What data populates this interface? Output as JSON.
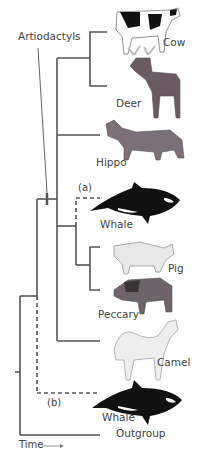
{
  "diagram": {
    "type": "phylogenetic_tree",
    "clade_label": "Artiodactyls",
    "time_axis_label": "Time",
    "alternative_placements": [
      {
        "label": "(a)",
        "description": "Whale nested within artiodactyls (dashed)"
      },
      {
        "label": "(b)",
        "description": "Whale as sister to artiodactyls (dashed)"
      }
    ],
    "taxa": [
      {
        "name": "Cow",
        "icon": "cow-illustration"
      },
      {
        "name": "Deer",
        "icon": "deer-illustration"
      },
      {
        "name": "Hippo",
        "icon": "hippo-illustration"
      },
      {
        "name": "Whale",
        "icon": "orca-illustration",
        "placement": "(a)"
      },
      {
        "name": "Pig",
        "icon": "pig-illustration"
      },
      {
        "name": "Peccary",
        "icon": "peccary-illustration"
      },
      {
        "name": "Camel",
        "icon": "camel-illustration"
      },
      {
        "name": "Whale",
        "icon": "orca-illustration",
        "placement": "(b)"
      },
      {
        "name": "Outgroup",
        "icon": ""
      }
    ],
    "colors": {
      "line": "#555555",
      "text": "#444444"
    }
  }
}
